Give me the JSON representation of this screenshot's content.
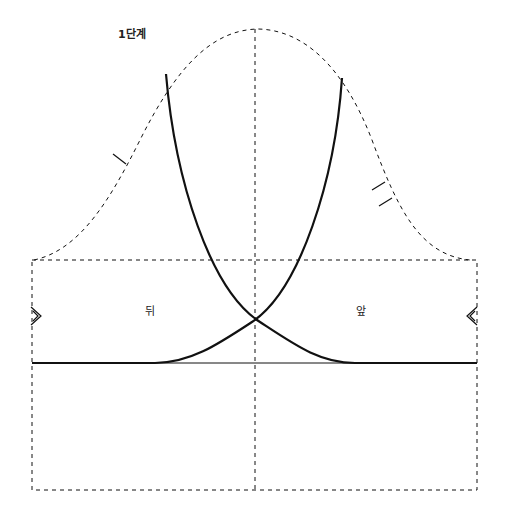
{
  "diagram": {
    "title": "1단계",
    "labels": {
      "back": "뒤",
      "front": "앞"
    },
    "colors": {
      "line": "#111111",
      "background": "#ffffff"
    },
    "elements": {
      "sleeve_cap_outline": "dashed",
      "center_line": "dashed",
      "body_rectangle": "dashed",
      "back_armhole_curve": "solid-thick",
      "front_armhole_curve": "solid-thick",
      "base_line": "solid",
      "notch_back_single": "single-tick",
      "notch_front_double": "double-tick",
      "side_marker_left": "double-chevron-right",
      "side_marker_right": "double-chevron-left"
    }
  }
}
